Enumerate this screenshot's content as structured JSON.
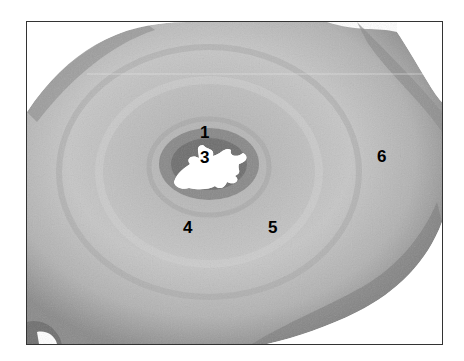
{
  "figure": {
    "type": "histology-micrograph",
    "labels": [
      {
        "id": "1",
        "text": "1",
        "x": 200,
        "y": 124
      },
      {
        "id": "3",
        "text": "3",
        "x": 200,
        "y": 149
      },
      {
        "id": "4",
        "text": "4",
        "x": 183,
        "y": 219
      },
      {
        "id": "5",
        "text": "5",
        "x": 268,
        "y": 219
      },
      {
        "id": "6",
        "text": "6",
        "x": 377,
        "y": 148
      }
    ],
    "colors": {
      "background": "#ffffff",
      "tissue_light": "#c8c8c8",
      "tissue_mid": "#a8a8a8",
      "tissue_dark": "#6e6e6e",
      "lumen": "#ffffff",
      "label": "#000000",
      "border": "#333333"
    }
  }
}
